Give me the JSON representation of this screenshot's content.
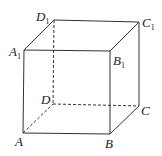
{
  "diagram": {
    "vertices": {
      "A": {
        "label": "A",
        "sub": ""
      },
      "B": {
        "label": "B",
        "sub": ""
      },
      "C": {
        "label": "C",
        "sub": ""
      },
      "D": {
        "label": "D",
        "sub": ""
      },
      "A1": {
        "label": "A",
        "sub": "1"
      },
      "B1": {
        "label": "B",
        "sub": "1"
      },
      "C1": {
        "label": "C",
        "sub": "1"
      },
      "D1": {
        "label": "D",
        "sub": "1"
      }
    },
    "colors": {
      "stroke": "#333333",
      "text": "#222222"
    }
  }
}
